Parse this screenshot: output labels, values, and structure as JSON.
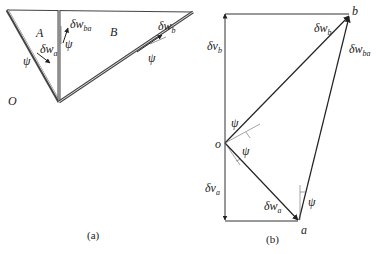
{
  "figure": {
    "panel_a": {
      "caption": "(a)",
      "labels": {
        "region_A": "A",
        "region_B": "B",
        "origin": "O",
        "psi_a": "ψ",
        "psi_ba": "ψ",
        "psi_b": "ψ",
        "dwa_main": "δw",
        "dwa_sub": "a",
        "dwba_main": "δw",
        "dwba_sub": "ba",
        "dwb_main": "δw",
        "dwb_sub": "b"
      }
    },
    "panel_b": {
      "caption": "(b)",
      "labels": {
        "point_b": "b",
        "point_o": "o",
        "point_a": "a",
        "dvb_main": "δv",
        "dvb_sub": "b",
        "dva_main": "δv",
        "dva_sub": "a",
        "dwb_main": "δw",
        "dwb_sub": "b",
        "dwba_main": "δw",
        "dwba_sub": "ba",
        "dwa_main": "δw",
        "dwa_sub": "a",
        "psi_top": "ψ",
        "psi_mid": "ψ",
        "psi_a": "ψ"
      }
    },
    "colors": {
      "line": "#333333",
      "text": "#222222"
    }
  }
}
